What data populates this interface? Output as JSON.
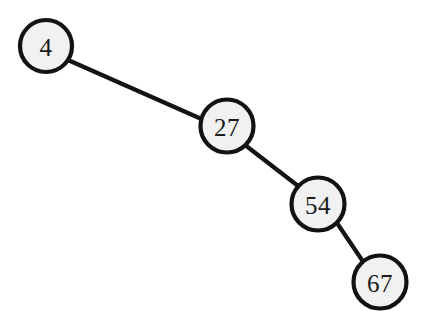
{
  "figure": {
    "type": "binary-search-tree-diagram",
    "background_color": "#ffffff",
    "width": 433,
    "height": 326
  },
  "style": {
    "node_fill": "#f1f1f1",
    "node_stroke": "#121212",
    "node_stroke_width": 4.2,
    "edge_color": "#141414",
    "edge_width": 4.2,
    "label_color": "#1a1a1a",
    "label_font_size": 25
  },
  "tree": {
    "root": "4",
    "nodes": [
      {
        "id": "n1",
        "label": "4",
        "cx": 46,
        "cy": 46,
        "r": 26.0,
        "depth": 0
      },
      {
        "id": "n2",
        "label": "27",
        "cx": 227,
        "cy": 126,
        "r": 26.5,
        "depth": 1
      },
      {
        "id": "n3",
        "label": "54",
        "cx": 318,
        "cy": 204,
        "r": 26.5,
        "depth": 2
      },
      {
        "id": "n4",
        "label": "67",
        "cx": 380,
        "cy": 282,
        "r": 26.5,
        "depth": 3
      }
    ],
    "edges": [
      {
        "id": "e1",
        "from": "n1",
        "to": "n2",
        "side": "right",
        "x1": 68,
        "y1": 60,
        "x2": 206,
        "y2": 121
      },
      {
        "id": "e2",
        "from": "n2",
        "to": "n3",
        "side": "right",
        "x1": 245,
        "y1": 145,
        "x2": 302,
        "y2": 189
      },
      {
        "id": "e3",
        "from": "n3",
        "to": "n4",
        "side": "right",
        "x1": 337,
        "y1": 223,
        "x2": 364,
        "y2": 263
      }
    ]
  }
}
